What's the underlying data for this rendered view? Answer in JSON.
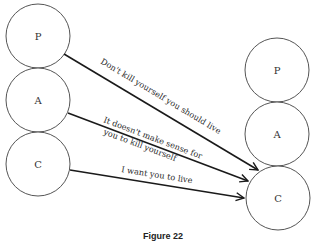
{
  "diagram": {
    "left_nodes": [
      {
        "id": "P",
        "label": "P"
      },
      {
        "id": "A",
        "label": "A"
      },
      {
        "id": "C",
        "label": "C"
      }
    ],
    "right_nodes": [
      {
        "id": "P",
        "label": "P"
      },
      {
        "id": "A",
        "label": "A"
      },
      {
        "id": "C",
        "label": "C"
      }
    ],
    "edges": [
      {
        "from": "left.P",
        "to": "right.C",
        "label_lines": [
          "Don't kill yourself you should live"
        ]
      },
      {
        "from": "left.A",
        "to": "right.C",
        "label_lines": [
          "It doesn't make sense for",
          "you to kill yourself"
        ]
      },
      {
        "from": "left.C",
        "to": "right.C",
        "label_lines": [
          "I want you to live"
        ]
      }
    ],
    "caption": "Figure 22"
  }
}
